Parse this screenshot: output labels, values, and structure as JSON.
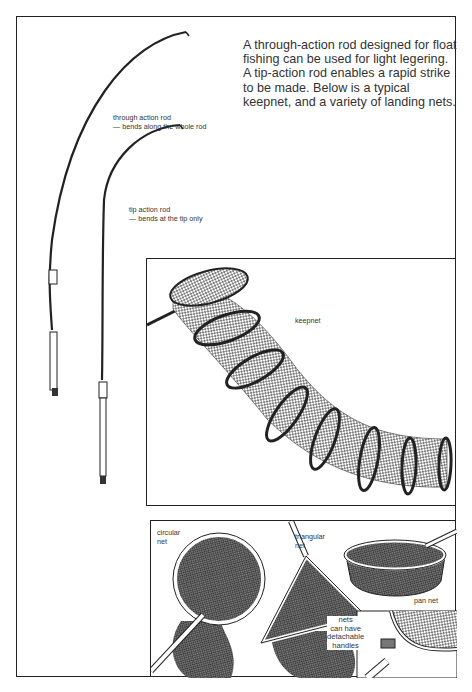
{
  "intro_text": "A through-action rod designed for float fishing can be used for light legering. A tip-action rod enables a rapid strike to be made. Below is a typical keepnet, and a variety of landing nets.",
  "rods": [
    {
      "label_line1": "through action rod",
      "label_line2": "— bends along the whole rod"
    },
    {
      "label_line1": "tip action rod",
      "label_line2": "— bends at the tip only"
    }
  ],
  "keepnet": {
    "label": "keepnet"
  },
  "landing_nets": {
    "circular": {
      "line1": "circular",
      "line2": "net"
    },
    "triangular": {
      "line1": "triangular",
      "line2": "net"
    },
    "pan": {
      "label": "pan net"
    },
    "handles_note": {
      "line1": "nets",
      "line2": "can have",
      "line3": "detachable",
      "line4": "handles"
    }
  },
  "colors": {
    "ink": "#222222",
    "paper": "#ffffff",
    "mesh": "#555555"
  }
}
